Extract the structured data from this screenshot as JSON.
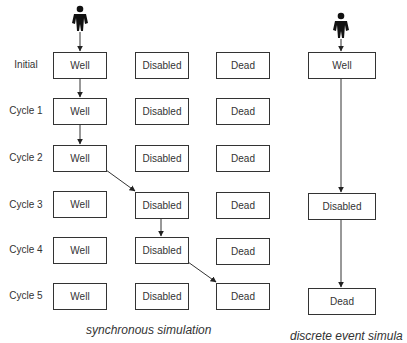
{
  "synchronous": {
    "caption": "synchronous simulation",
    "columns": [
      "Well",
      "Disabled",
      "Dead"
    ],
    "rows": [
      {
        "label": "Initial",
        "states": [
          "Well",
          "Disabled",
          "Dead"
        ]
      },
      {
        "label": "Cycle 1",
        "states": [
          "Well",
          "Disabled",
          "Dead"
        ]
      },
      {
        "label": "Cycle 2",
        "states": [
          "Well",
          "Disabled",
          "Dead"
        ]
      },
      {
        "label": "Cycle 3",
        "states": [
          "Well",
          "Disabled",
          "Dead"
        ]
      },
      {
        "label": "Cycle 4",
        "states": [
          "Well",
          "Disabled",
          "Dead"
        ]
      },
      {
        "label": "Cycle 5",
        "states": [
          "Well",
          "Disabled",
          "Dead"
        ]
      }
    ],
    "path": [
      "Initial:Well",
      "Cycle 1:Well",
      "Cycle 2:Well",
      "Cycle 3:Disabled",
      "Cycle 4:Disabled",
      "Cycle 5:Dead"
    ]
  },
  "discrete_event": {
    "caption": "discrete event simula",
    "states": [
      "Well",
      "Disabled",
      "Dead"
    ]
  },
  "icons": {
    "person": "person-icon"
  },
  "colors": {
    "stroke": "#333333",
    "background": "#ffffff"
  }
}
